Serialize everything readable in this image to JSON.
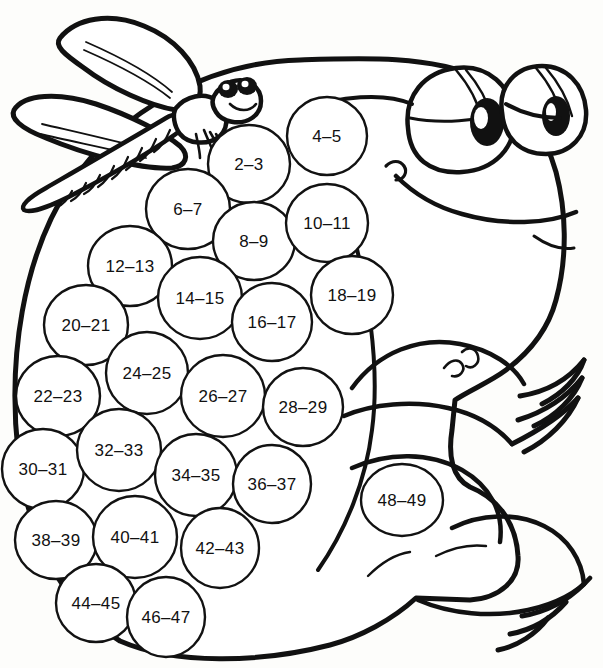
{
  "page": {
    "background_color": "#fdfdfb",
    "ink_color": "#111111",
    "width": 603,
    "height": 668
  },
  "artwork": {
    "subject": "frog",
    "companion": "dragonfly",
    "style": "black-and-white line art coloring page",
    "numbered_regions_count": 25
  },
  "regions": [
    {
      "label": "2–3",
      "cx": 249,
      "cy": 164,
      "rx": 41,
      "ry": 39
    },
    {
      "label": "4–5",
      "cx": 327,
      "cy": 136,
      "rx": 40,
      "ry": 39
    },
    {
      "label": "6–7",
      "cx": 188,
      "cy": 209,
      "rx": 42,
      "ry": 40
    },
    {
      "label": "8–9",
      "cx": 254,
      "cy": 241,
      "rx": 41,
      "ry": 39
    },
    {
      "label": "10–11",
      "cx": 327,
      "cy": 223,
      "rx": 41,
      "ry": 39
    },
    {
      "label": "12–13",
      "cx": 130,
      "cy": 266,
      "rx": 42,
      "ry": 40
    },
    {
      "label": "14–15",
      "cx": 200,
      "cy": 298,
      "rx": 42,
      "ry": 41
    },
    {
      "label": "16–17",
      "cx": 272,
      "cy": 322,
      "rx": 40,
      "ry": 39
    },
    {
      "label": "18–19",
      "cx": 352,
      "cy": 295,
      "rx": 41,
      "ry": 39
    },
    {
      "label": "20–21",
      "cx": 86,
      "cy": 325,
      "rx": 42,
      "ry": 40
    },
    {
      "label": "22–23",
      "cx": 58,
      "cy": 396,
      "rx": 42,
      "ry": 40
    },
    {
      "label": "24–25",
      "cx": 147,
      "cy": 373,
      "rx": 41,
      "ry": 41
    },
    {
      "label": "26–27",
      "cx": 223,
      "cy": 396,
      "rx": 42,
      "ry": 41
    },
    {
      "label": "28–29",
      "cx": 303,
      "cy": 407,
      "rx": 40,
      "ry": 39
    },
    {
      "label": "30–31",
      "cx": 43,
      "cy": 469,
      "rx": 41,
      "ry": 40
    },
    {
      "label": "32–33",
      "cx": 119,
      "cy": 450,
      "rx": 42,
      "ry": 41
    },
    {
      "label": "34–35",
      "cx": 196,
      "cy": 475,
      "rx": 41,
      "ry": 41
    },
    {
      "label": "36–37",
      "cx": 272,
      "cy": 484,
      "rx": 39,
      "ry": 39
    },
    {
      "label": "38–39",
      "cx": 56,
      "cy": 540,
      "rx": 41,
      "ry": 39
    },
    {
      "label": "40–41",
      "cx": 135,
      "cy": 537,
      "rx": 42,
      "ry": 41
    },
    {
      "label": "42–43",
      "cx": 220,
      "cy": 548,
      "rx": 39,
      "ry": 40
    },
    {
      "label": "44–45",
      "cx": 96,
      "cy": 603,
      "rx": 40,
      "ry": 39
    },
    {
      "label": "46–47",
      "cx": 166,
      "cy": 617,
      "rx": 39,
      "ry": 40
    },
    {
      "label": "48–49",
      "cx": 402,
      "cy": 500,
      "rx": 41,
      "ry": 36
    }
  ]
}
